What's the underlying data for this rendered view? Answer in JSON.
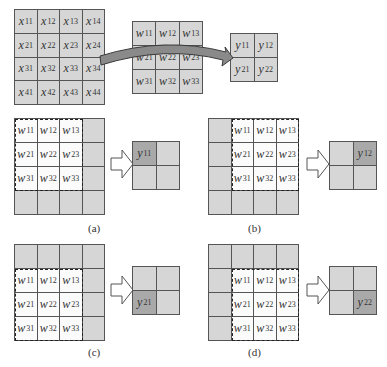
{
  "top": {
    "input": {
      "name": "x",
      "rows": [
        [
          "11",
          "12",
          "13",
          "14"
        ],
        [
          "21",
          "22",
          "23",
          "24"
        ],
        [
          "31",
          "32",
          "33",
          "34"
        ],
        [
          "41",
          "42",
          "43",
          "44"
        ]
      ]
    },
    "kernel": {
      "name": "w",
      "rows": [
        [
          "11",
          "12",
          "13"
        ],
        [
          "21",
          "22",
          "23"
        ],
        [
          "31",
          "32",
          "33"
        ]
      ]
    },
    "output": {
      "name": "y",
      "rows": [
        [
          "11",
          "12"
        ],
        [
          "21",
          "22"
        ]
      ]
    },
    "arrow_icon": "curved-arrow"
  },
  "panels": [
    {
      "label": "(a)",
      "window_row": 0,
      "window_col": 0,
      "output_symbol": "y",
      "output_index": "11",
      "out_row": 0,
      "out_col": 0
    },
    {
      "label": "(b)",
      "window_row": 0,
      "window_col": 1,
      "output_symbol": "y",
      "output_index": "12",
      "out_row": 0,
      "out_col": 1
    },
    {
      "label": "(c)",
      "window_row": 1,
      "window_col": 0,
      "output_symbol": "y",
      "output_index": "21",
      "out_row": 1,
      "out_col": 0
    },
    {
      "label": "(d)",
      "window_row": 1,
      "window_col": 1,
      "output_symbol": "y",
      "output_index": "22",
      "out_row": 1,
      "out_col": 1
    }
  ],
  "colors": {
    "cell_fill": "#d6d6d6",
    "window_fill": "#fbfbfb",
    "active_output": "#a9a9a9",
    "grid_line": "#555555"
  }
}
